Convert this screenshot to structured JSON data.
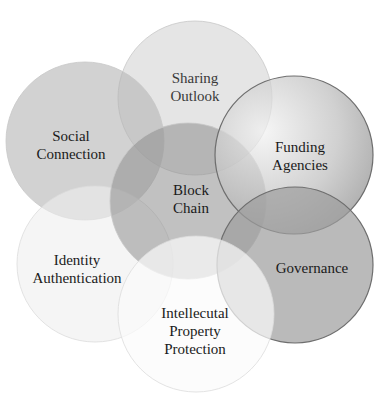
{
  "diagram": {
    "type": "overlapping-circles",
    "center": {
      "id": "block-chain",
      "lines": [
        "Block",
        "Chain"
      ],
      "cx": 188,
      "cy": 201,
      "r": 78,
      "fill": "#8e8e8e",
      "opacity": 0.55
    },
    "petals": [
      {
        "id": "sharing-outlook",
        "lines": [
          "Sharing",
          "Outlook"
        ],
        "cx": 195,
        "cy": 98,
        "r": 77,
        "fill": "#d4d4d4",
        "opacity": 0.6,
        "label_x": 195,
        "label_y": 87
      },
      {
        "id": "social-connection",
        "lines": [
          "Social",
          "Connection"
        ],
        "cx": 85,
        "cy": 141,
        "r": 79,
        "fill": "#b4b4b4",
        "opacity": 0.6,
        "label_x": 71,
        "label_y": 145
      },
      {
        "id": "funding-agencies",
        "lines": [
          "Funding",
          "Agencies"
        ],
        "cx": 294,
        "cy": 155,
        "r": 79,
        "fill": "#a9a9a9",
        "opacity": 0.7,
        "label_x": 300,
        "label_y": 156
      },
      {
        "id": "governance",
        "lines": [
          "Governance"
        ],
        "cx": 295,
        "cy": 265,
        "r": 78,
        "fill": "#9c9c9c",
        "opacity": 0.7,
        "label_x": 312,
        "label_y": 268
      },
      {
        "id": "identity-authentication",
        "lines": [
          "Identity",
          "Authentication"
        ],
        "cx": 95,
        "cy": 264,
        "r": 78,
        "fill": "#eeeeee",
        "opacity": 0.6,
        "label_x": 77,
        "label_y": 269
      },
      {
        "id": "intellectual-property-protection",
        "lines": [
          "Intellecutal",
          "Property",
          "Protection"
        ],
        "cx": 196,
        "cy": 314,
        "r": 78,
        "fill": "#fbfbfb",
        "opacity": 0.7,
        "label_x": 195,
        "label_y": 331
      }
    ]
  }
}
